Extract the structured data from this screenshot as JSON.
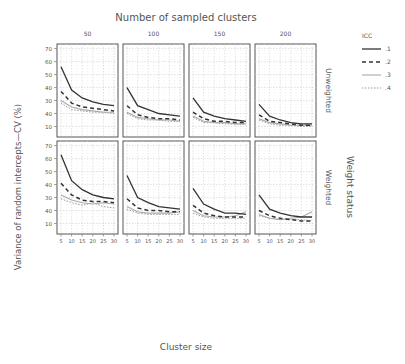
{
  "chart_data": {
    "type": "line",
    "title": "Number of sampled clusters",
    "xlabel": "Cluster size",
    "ylabel": "Variance of random intercepts—CV (%)",
    "row_facet_label": "Weight status",
    "col_facet_label": "Number of sampled clusters",
    "columns": [
      "50",
      "100",
      "150",
      "200"
    ],
    "rows": [
      "Unweighted",
      "Weighted"
    ],
    "x": [
      5,
      10,
      15,
      20,
      25,
      30
    ],
    "x_ticks": [
      "5",
      "10",
      "15",
      "20",
      "25",
      "30"
    ],
    "y_ticks": [
      "10",
      "40",
      "30",
      "40",
      "50",
      "60",
      "70"
    ],
    "ylim": [
      5,
      72
    ],
    "grid": true,
    "legend": {
      "title": "ICC",
      "position": "right-top",
      "entries": [
        ".1",
        ".2",
        ".3",
        ".4"
      ],
      "styles": [
        "solid-dark",
        "dashed-dark",
        "solid-light",
        "dotted-light"
      ]
    },
    "panels": [
      {
        "row": "Unweighted",
        "col": "50",
        "series": [
          {
            "name": ".1",
            "values": [
              56,
              38,
              32,
              29,
              27,
              26
            ]
          },
          {
            "name": ".2",
            "values": [
              37,
              28,
              25,
              24,
              23,
              22
            ]
          },
          {
            "name": ".3",
            "values": [
              30,
              25,
              23,
              22,
              21,
              21
            ]
          },
          {
            "name": ".4",
            "values": [
              28,
              23,
              22,
              21,
              21,
              20
            ]
          }
        ]
      },
      {
        "row": "Unweighted",
        "col": "100",
        "series": [
          {
            "name": ".1",
            "values": [
              40,
              26,
              23,
              20,
              19,
              18
            ]
          },
          {
            "name": ".2",
            "values": [
              26,
              19,
              17,
              16,
              16,
              15
            ]
          },
          {
            "name": ".3",
            "values": [
              21,
              17,
              16,
              15,
              15,
              14
            ]
          },
          {
            "name": ".4",
            "values": [
              20,
              16,
              15,
              15,
              14,
              14
            ]
          }
        ]
      },
      {
        "row": "Unweighted",
        "col": "150",
        "series": [
          {
            "name": ".1",
            "values": [
              32,
              21,
              18,
              16,
              15,
              14
            ]
          },
          {
            "name": ".2",
            "values": [
              21,
              16,
              14,
              14,
              13,
              13
            ]
          },
          {
            "name": ".3",
            "values": [
              18,
              14,
              13,
              13,
              12,
              12
            ]
          },
          {
            "name": ".4",
            "values": [
              17,
              13,
              13,
              12,
              12,
              12
            ]
          }
        ]
      },
      {
        "row": "Unweighted",
        "col": "200",
        "series": [
          {
            "name": ".1",
            "values": [
              27,
              18,
              15,
              13,
              12,
              12
            ]
          },
          {
            "name": ".2",
            "values": [
              19,
              14,
              13,
              12,
              11,
              11
            ]
          },
          {
            "name": ".3",
            "values": [
              16,
              13,
              12,
              11,
              11,
              11
            ]
          },
          {
            "name": ".4",
            "values": [
              15,
              12,
              11,
              11,
              10,
              10
            ]
          }
        ]
      },
      {
        "row": "Weighted",
        "col": "50",
        "series": [
          {
            "name": ".1",
            "values": [
              63,
              43,
              36,
              32,
              30,
              29
            ]
          },
          {
            "name": ".2",
            "values": [
              41,
              32,
              28,
              27,
              27,
              26
            ]
          },
          {
            "name": ".3",
            "values": [
              32,
              28,
              26,
              25,
              26,
              25
            ]
          },
          {
            "name": ".4",
            "values": [
              29,
              26,
              24,
              26,
              23,
              22
            ]
          }
        ]
      },
      {
        "row": "Weighted",
        "col": "100",
        "series": [
          {
            "name": ".1",
            "values": [
              47,
              30,
              26,
              23,
              22,
              21
            ]
          },
          {
            "name": ".2",
            "values": [
              29,
              22,
              20,
              20,
              19,
              19
            ]
          },
          {
            "name": ".3",
            "values": [
              23,
              19,
              18,
              18,
              18,
              19
            ]
          },
          {
            "name": ".4",
            "values": [
              21,
              18,
              17,
              17,
              17,
              17
            ]
          }
        ]
      },
      {
        "row": "Weighted",
        "col": "150",
        "series": [
          {
            "name": ".1",
            "values": [
              37,
              25,
              21,
              18,
              18,
              17
            ]
          },
          {
            "name": ".2",
            "values": [
              24,
              18,
              16,
              15,
              15,
              15
            ]
          },
          {
            "name": ".3",
            "values": [
              20,
              16,
              15,
              15,
              16,
              19
            ]
          },
          {
            "name": ".4",
            "values": [
              18,
              15,
              14,
              14,
              14,
              14
            ]
          }
        ]
      },
      {
        "row": "Weighted",
        "col": "200",
        "series": [
          {
            "name": ".1",
            "values": [
              32,
              21,
              18,
              16,
              15,
              15
            ]
          },
          {
            "name": ".2",
            "values": [
              20,
              16,
              14,
              13,
              12,
              12
            ]
          },
          {
            "name": ".3",
            "values": [
              17,
              14,
              13,
              14,
              15,
              19
            ]
          },
          {
            "name": ".4",
            "values": [
              16,
              14,
              13,
              13,
              13,
              12
            ]
          }
        ]
      }
    ]
  }
}
